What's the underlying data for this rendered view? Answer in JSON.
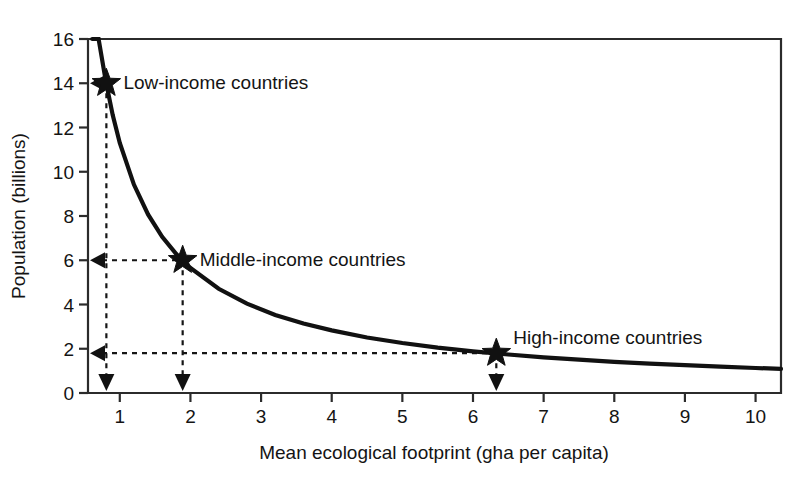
{
  "chart_data": {
    "type": "line",
    "title": "",
    "xlabel": "Mean ecological footprint (gha per capita)",
    "ylabel": "Population (billions)",
    "xlim": [
      0.55,
      10.36
    ],
    "ylim": [
      0,
      16
    ],
    "xticks": [
      "1",
      "2",
      "3",
      "4",
      "5",
      "6",
      "7",
      "8",
      "9",
      "10"
    ],
    "xtick_values": [
      1,
      2,
      3,
      4,
      5,
      6,
      7,
      8,
      9,
      10
    ],
    "yticks": [
      "0",
      "2",
      "4",
      "6",
      "8",
      "10",
      "12",
      "14",
      "16"
    ],
    "ytick_values": [
      0,
      2,
      4,
      6,
      8,
      10,
      12,
      14,
      16
    ],
    "grid": false,
    "legend_position": "none",
    "curve_relation": "population x footprint = 11.3 (constant biocapacity hyperbola)",
    "curve_constant": 11.3,
    "series": [
      {
        "name": "Biocapacity constraint curve",
        "x": [
          0.61,
          0.7,
          0.8,
          0.9,
          1.0,
          1.2,
          1.4,
          1.6,
          1.8,
          2.0,
          2.4,
          2.8,
          3.2,
          3.6,
          4.0,
          4.5,
          5.0,
          5.5,
          6.0,
          6.5,
          7.0,
          7.5,
          8.0,
          8.5,
          9.0,
          9.5,
          10.0,
          10.36
        ],
        "y": [
          16.0,
          16.14,
          14.13,
          12.56,
          11.3,
          9.42,
          8.07,
          7.06,
          6.28,
          5.65,
          4.71,
          4.04,
          3.53,
          3.14,
          2.83,
          2.51,
          2.26,
          2.05,
          1.88,
          1.74,
          1.61,
          1.51,
          1.41,
          1.33,
          1.26,
          1.19,
          1.13,
          1.09
        ]
      }
    ],
    "annotations": [
      {
        "id": "low-income",
        "label": "Low-income countries",
        "x": 0.81,
        "y": 14.0,
        "marker": "star",
        "guides": [
          "to-y-axis",
          "to-x-axis"
        ]
      },
      {
        "id": "middle-income",
        "label": "Middle-income countries",
        "x": 1.89,
        "y": 6.0,
        "marker": "star",
        "guides": [
          "to-y-axis",
          "to-x-axis"
        ]
      },
      {
        "id": "high-income",
        "label": "High-income countries",
        "x": 6.33,
        "y": 1.8,
        "marker": "star",
        "guides": [
          "to-y-axis",
          "to-x-axis"
        ]
      }
    ]
  },
  "axis": {
    "x_title": "Mean ecological footprint (gha per capita)",
    "y_title": "Population (billions)",
    "x_tick_labels": [
      "1",
      "2",
      "3",
      "4",
      "5",
      "6",
      "7",
      "8",
      "9",
      "10"
    ],
    "y_tick_labels": [
      "16",
      "14",
      "12",
      "10",
      "8",
      "6",
      "4",
      "2",
      "0"
    ]
  },
  "labels": {
    "low_income": "Low-income countries",
    "middle_income": "Middle-income countries",
    "high_income": "High-income countries"
  },
  "colors": {
    "background": "#ffffff",
    "curve": "#111111",
    "axis": "#2b2b2b",
    "guide": "#151515",
    "marker": "#111111",
    "text": "#141414"
  }
}
